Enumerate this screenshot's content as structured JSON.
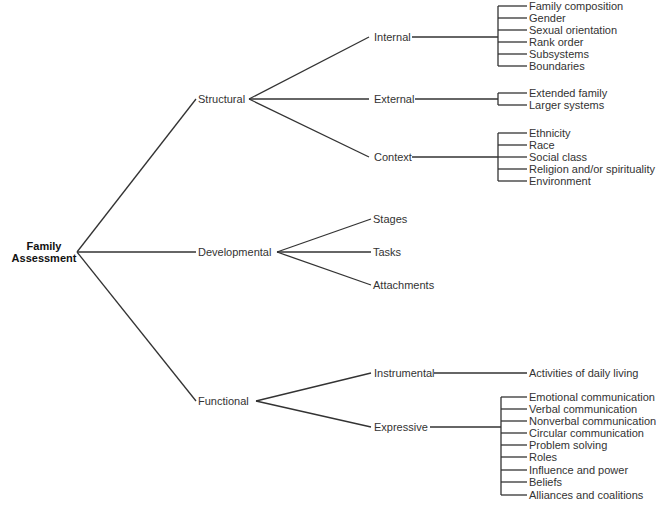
{
  "root": {
    "line1": "Family",
    "line2": "Assessment"
  },
  "branches": {
    "structural": {
      "label": "Structural",
      "internal": {
        "label": "Internal",
        "items": [
          "Family composition",
          "Gender",
          "Sexual orientation",
          "Rank order",
          "Subsystems",
          "Boundaries"
        ]
      },
      "external": {
        "label": "External",
        "items": [
          "Extended family",
          "Larger systems"
        ]
      },
      "context": {
        "label": "Context",
        "items": [
          "Ethnicity",
          "Race",
          "Social class",
          "Religion and/or spirituality",
          "Environment"
        ]
      }
    },
    "developmental": {
      "label": "Developmental",
      "items": [
        "Stages",
        "Tasks",
        "Attachments"
      ]
    },
    "functional": {
      "label": "Functional",
      "instrumental": {
        "label": "Instrumental",
        "items": [
          "Activities of daily living"
        ]
      },
      "expressive": {
        "label": "Expressive",
        "items": [
          "Emotional communication",
          "Verbal communication",
          "Nonverbal communication",
          "Circular communication",
          "Problem solving",
          "Roles",
          "Influence and power",
          "Beliefs",
          "Alliances and coalitions"
        ]
      }
    }
  }
}
